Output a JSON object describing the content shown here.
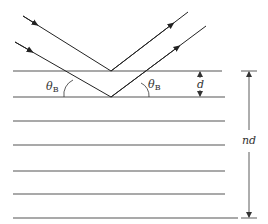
{
  "diagram": {
    "labels": {
      "angle_left": "θ",
      "angle_left_sub": "B",
      "angle_right": "θ",
      "angle_right_sub": "B",
      "spacing": "d",
      "total_thickness": "nd"
    },
    "layer_count": 7,
    "rays": [
      {
        "name": "incident-ray-upper",
        "direction": "incoming"
      },
      {
        "name": "incident-ray-lower",
        "direction": "incoming"
      },
      {
        "name": "reflected-ray-upper",
        "direction": "outgoing"
      },
      {
        "name": "reflected-ray-lower",
        "direction": "outgoing"
      }
    ],
    "colors": {
      "line": "#555555",
      "ray": "#222222",
      "background": "#ffffff"
    }
  }
}
